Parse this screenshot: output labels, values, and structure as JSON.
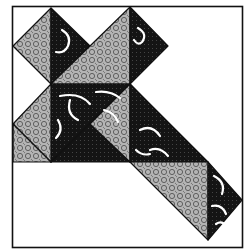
{
  "figure": {
    "colors": {
      "background": "#ffffff",
      "outline": "#111111",
      "dark_fabric": "#141414",
      "light_fabric": "#a8a8a8",
      "motif": "#ffffff"
    },
    "pieces": [
      {
        "name": "left-diamond-light",
        "fabric": "light"
      },
      {
        "name": "left-diamond-dark",
        "fabric": "dark"
      },
      {
        "name": "upper-band-light",
        "fabric": "light"
      },
      {
        "name": "upper-right-diamond-dark",
        "fabric": "dark"
      },
      {
        "name": "center-dark",
        "fabric": "dark"
      },
      {
        "name": "center-left-light",
        "fabric": "light"
      },
      {
        "name": "lower-band-light",
        "fabric": "light"
      },
      {
        "name": "diagonal-dark-1",
        "fabric": "dark"
      },
      {
        "name": "diagonal-dark-2",
        "fabric": "dark"
      },
      {
        "name": "bottom-light",
        "fabric": "light"
      },
      {
        "name": "bottom-right-dark",
        "fabric": "dark"
      }
    ]
  }
}
